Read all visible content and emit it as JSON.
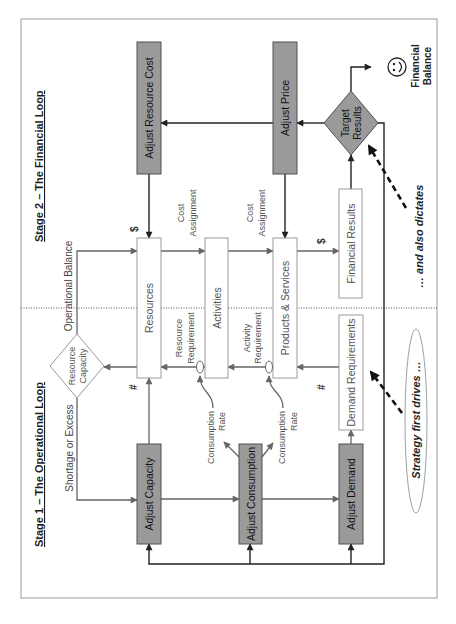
{
  "diagram": {
    "titles": {
      "stage1": "Stage 1 – The Operational Loop",
      "stage2": "Stage 2 – The Financial Loop"
    },
    "nodes": {
      "adjust_resource_cost": "Adjust Resource Cost",
      "adjust_price": "Adjust Price",
      "adjust_capacity": "Adjust Capacity",
      "adjust_consumption": "Adjust Consumption",
      "adjust_demand": "Adjust Demand",
      "resources": "Resources",
      "activities": "Activities",
      "products_services": "Products & Services",
      "financial_results": "Financial Results",
      "demand_requirements": "Demand Requirements",
      "target_results": [
        "Target",
        "Results"
      ],
      "resource_capacity": [
        "Resource",
        "Capacity"
      ]
    },
    "edge_labels": {
      "operational_balance": "Operational Balance",
      "shortage_or_excess": "Shortage or Excess",
      "cost_assignment_1": [
        "Cost",
        "Assignment"
      ],
      "cost_assignment_2": [
        "Cost",
        "Assignment"
      ],
      "resource_requirement": [
        "Resource",
        "Requirement"
      ],
      "activity_requirement": [
        "Activity",
        "Requirement"
      ],
      "consumption_rate_1": [
        "Consumption",
        "Rate"
      ],
      "consumption_rate_2": [
        "Consumption",
        "Rate"
      ],
      "dollar_resources": "$",
      "dollar_financial": "$",
      "count_resources": "#",
      "count_demand": "#"
    },
    "annotations": {
      "financial_balance": [
        "Financial",
        "Balance"
      ],
      "and_also_dictates": "… and also dictates",
      "strategy_first_drives": "Strategy first drives …",
      "outcome_icon": "smiley-face"
    },
    "edges": [
      {
        "from": "Target Results",
        "to": "Adjust Price"
      },
      {
        "from": "Target Results",
        "to": "Adjust Resource Cost"
      },
      {
        "from": "Target Results",
        "to": "Financial Balance"
      },
      {
        "from": "Target Results",
        "to": "Adjust Capacity"
      },
      {
        "from": "Target Results",
        "to": "Adjust Consumption"
      },
      {
        "from": "Target Results",
        "to": "Adjust Demand"
      },
      {
        "from": "Adjust Resource Cost",
        "to": "Resources"
      },
      {
        "from": "Adjust Price",
        "to": "Products & Services"
      },
      {
        "from": "Resources",
        "to": "Activities",
        "label": "Cost Assignment"
      },
      {
        "from": "Activities",
        "to": "Products & Services",
        "label": "Cost Assignment"
      },
      {
        "from": "Products & Services",
        "to": "Financial Results",
        "label": "$"
      },
      {
        "from": "Financial Results",
        "to": "Target Results"
      },
      {
        "from": "Resource Capacity",
        "to": "Resources",
        "label": "Operational Balance"
      },
      {
        "from": "Resource Capacity",
        "to": "Adjust Capacity",
        "label": "Shortage or Excess"
      },
      {
        "from": "Resources",
        "to": "Resource Capacity"
      },
      {
        "from": "Activities",
        "to": "Resources",
        "label": "Resource Requirement"
      },
      {
        "from": "Products & Services",
        "to": "Activities",
        "label": "Activity Requirement"
      },
      {
        "from": "Demand Requirements",
        "to": "Products & Services"
      },
      {
        "from": "Adjust Capacity",
        "to": "Resources",
        "label": "#"
      },
      {
        "from": "Adjust Capacity",
        "to": "Adjust Consumption"
      },
      {
        "from": "Adjust Consumption",
        "to": "Adjust Demand"
      },
      {
        "from": "Adjust Consumption",
        "to": "Consumption Rate (Resource Requirement)"
      },
      {
        "from": "Adjust Consumption",
        "to": "Consumption Rate (Activity Requirement)"
      },
      {
        "from": "Adjust Demand",
        "to": "Demand Requirements"
      },
      {
        "from": "Strategy first drives …",
        "to": "Demand Requirements",
        "style": "dashed"
      },
      {
        "from": "… and also dictates",
        "to": "Target Results",
        "style": "dashed"
      }
    ],
    "colors": {
      "adjust_box_fill": "#9a9a9a",
      "process_box_fill": "#ffffff",
      "line_dark": "#222222",
      "line_gray": "#666666",
      "frame": "#999999"
    }
  }
}
